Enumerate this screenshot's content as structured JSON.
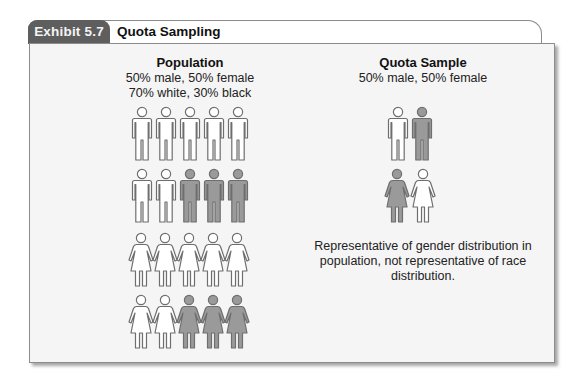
{
  "exhibit": {
    "tab_label": "Exhibit 5.7",
    "title": "Quota Sampling"
  },
  "colors": {
    "tab_bg": "#5e5e5e",
    "white_figure_fill": "#ffffff",
    "black_figure_fill": "#9a9a9a",
    "figure_stroke": "#6e6e6e",
    "panel_bg": "#f5f5f5"
  },
  "population": {
    "heading": "Population",
    "line1": "50% male, 50% female",
    "line2": "70% white, 30% black",
    "rows": [
      {
        "gender": "male",
        "figures": [
          "white",
          "white",
          "white",
          "white",
          "white"
        ]
      },
      {
        "gender": "male",
        "figures": [
          "white",
          "white",
          "black",
          "black",
          "black"
        ]
      },
      {
        "gender": "female",
        "figures": [
          "white",
          "white",
          "white",
          "white",
          "white"
        ]
      },
      {
        "gender": "female",
        "figures": [
          "white",
          "white",
          "black",
          "black",
          "black"
        ]
      }
    ]
  },
  "quota_sample": {
    "heading": "Quota Sample",
    "line1": "50% male, 50% female",
    "rows": [
      {
        "gender": "male",
        "figures": [
          "white",
          "black"
        ]
      },
      {
        "gender": "female",
        "figures": [
          "black",
          "white"
        ]
      }
    ],
    "caption": "Representative of gender distribution in population, not representative of race distribution."
  }
}
